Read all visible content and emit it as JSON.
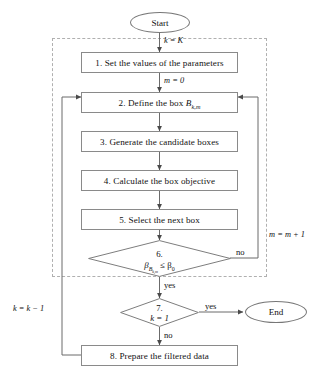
{
  "diagram": {
    "type": "flowchart",
    "colors": {
      "node_border": "#8a8a8a",
      "region_border": "#b0b0b0",
      "line": "#555555",
      "background": "#ffffff",
      "text": "#111111"
    },
    "nodes": {
      "start": {
        "label": "Start",
        "shape": "terminator"
      },
      "step1": {
        "label": "1. Set the values of the parameters",
        "shape": "process"
      },
      "step2_prefix": "2. Define the box ",
      "step2_symbol": "B",
      "step2_subscript": "k,m",
      "step3": {
        "label": "3. Generate the candidate boxes",
        "shape": "process"
      },
      "step4": {
        "label": "4. Calculate the box objective",
        "shape": "process"
      },
      "step5": {
        "label": "5. Select the next box",
        "shape": "process"
      },
      "decision6_number": "6.",
      "decision6_condition_beta": "β",
      "decision6_condition_sub": "B",
      "decision6_condition_sub2": "k,m",
      "decision6_condition_rel": " ≤ β",
      "decision6_condition_rhs": "0",
      "decision7_number": "7.",
      "decision7_condition": "k = 1",
      "step8": {
        "label": "8. Prepare the filtered data",
        "shape": "process"
      },
      "end": {
        "label": "End",
        "shape": "terminator"
      }
    },
    "edge_labels": {
      "init_k": "k = K",
      "init_m": "m = 0",
      "increment_m": "m = m + 1",
      "decrement_k": "k = k − 1",
      "d6_no": "no",
      "d6_yes": "yes",
      "d7_yes": "yes",
      "d7_no": "no"
    }
  }
}
